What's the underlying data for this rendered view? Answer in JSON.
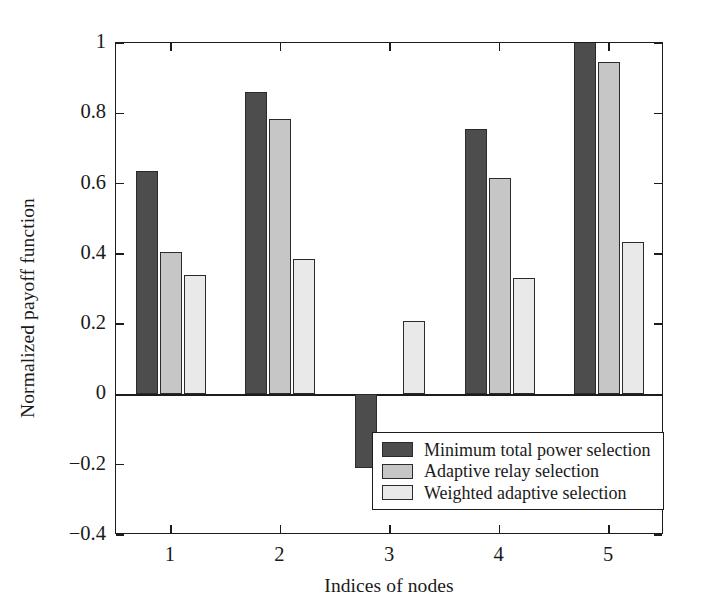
{
  "chart_data": {
    "type": "bar",
    "title": "",
    "xlabel": "Indices of nodes",
    "ylabel": "Normalized payoff function",
    "categories": [
      "1",
      "2",
      "3",
      "4",
      "5"
    ],
    "series": [
      {
        "name": "Minimum total power selection",
        "color": "#4d4d4d",
        "values": [
          0.635,
          0.86,
          -0.21,
          0.755,
          1.0
        ]
      },
      {
        "name": "Adaptive relay selection",
        "color": "#c6c6c6",
        "values": [
          0.405,
          0.785,
          0.0,
          0.615,
          0.945
        ]
      },
      {
        "name": "Weighted adaptive selection",
        "color": "#e9e9e9",
        "values": [
          0.34,
          0.385,
          0.21,
          0.33,
          0.435
        ]
      }
    ],
    "ylim": [
      -0.4,
      1.0
    ],
    "yticks": [
      -0.4,
      -0.2,
      0,
      0.2,
      0.4,
      0.6,
      0.8,
      1
    ],
    "ytick_labels": [
      "-0.4",
      "-0.2",
      "0",
      "0.2",
      "0.4",
      "0.6",
      "0.8",
      "1"
    ],
    "xticks": [
      1,
      2,
      3,
      4,
      5
    ],
    "xtick_labels": [
      "1",
      "2",
      "3",
      "4",
      "5"
    ],
    "grid": false,
    "legend_position": "lower right",
    "legend_entries": [
      "Minimum total power selection",
      "Adaptive relay selection",
      "Weighted adaptive selection"
    ]
  },
  "axes": {
    "ylabel": "Normalized payoff function",
    "xlabel": "Indices of nodes"
  }
}
